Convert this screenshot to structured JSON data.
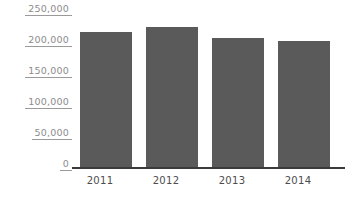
{
  "chart_data": {
    "type": "bar",
    "title": "",
    "subtitle": "",
    "xlabel": "",
    "ylabel": "",
    "categories": [
      "2011",
      "2012",
      "2013",
      "2014"
    ],
    "values": [
      220000,
      228000,
      210000,
      205000
    ],
    "series": [
      {
        "name": "",
        "values": [
          220000,
          228000,
          210000,
          205000
        ]
      }
    ],
    "ylim": [
      0,
      250000
    ],
    "ytick_values": [
      0,
      50000,
      100000,
      150000,
      200000,
      250000
    ],
    "ytick_labels": [
      "0",
      "50,000",
      "100,000",
      "150,000",
      "200,000",
      "250,000"
    ],
    "grid": false,
    "legend": false,
    "legend_position": "none",
    "annotations": [],
    "colors": {
      "bar": "#5a5a5a",
      "axis_line": "#3a3a3a",
      "tick_label": "#8c8c8c",
      "category_label": "#4d4d4d",
      "background": "#ffffff"
    }
  }
}
